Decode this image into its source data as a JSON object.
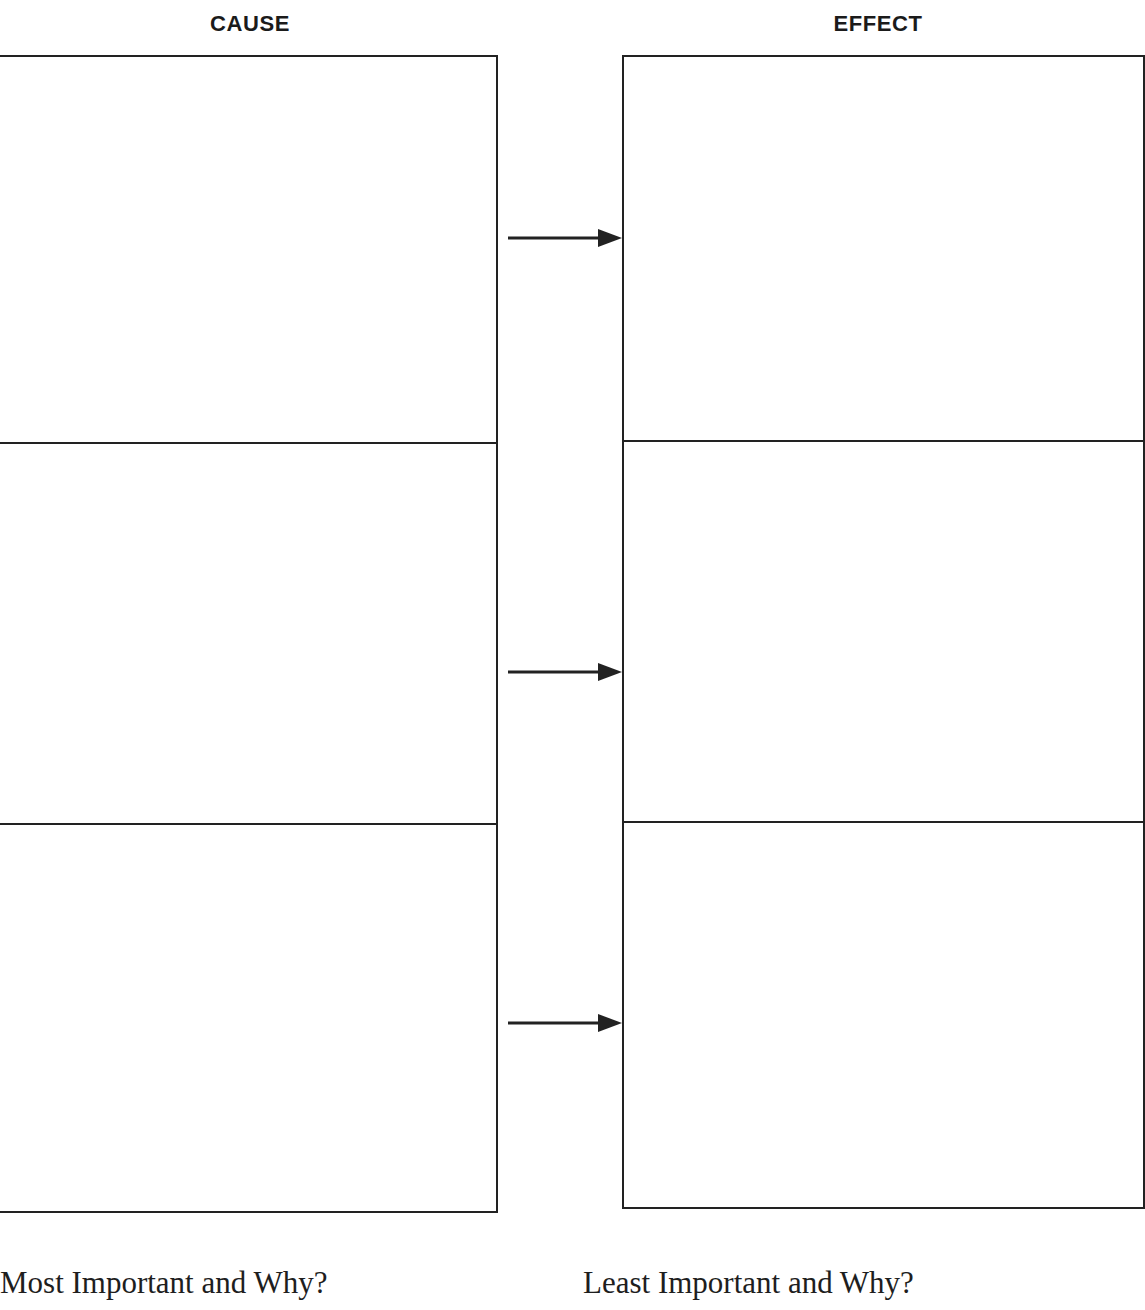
{
  "worksheet": {
    "title": "Cause and Effect Graphic Organizer",
    "columns": [
      {
        "id": "cause",
        "header": "CAUSE",
        "cells": [
          {
            "id": "cause-1",
            "value": ""
          },
          {
            "id": "cause-2",
            "value": ""
          },
          {
            "id": "cause-3",
            "value": ""
          }
        ]
      },
      {
        "id": "effect",
        "header": "EFFECT",
        "cells": [
          {
            "id": "effect-1",
            "value": ""
          },
          {
            "id": "effect-2",
            "value": ""
          },
          {
            "id": "effect-3",
            "value": ""
          }
        ]
      }
    ],
    "connectors": [
      {
        "id": "arrow-1",
        "from": "cause-1",
        "to": "effect-1",
        "direction": "right"
      },
      {
        "id": "arrow-2",
        "from": "cause-2",
        "to": "effect-2",
        "direction": "right"
      },
      {
        "id": "arrow-3",
        "from": "cause-3",
        "to": "effect-3",
        "direction": "right"
      }
    ],
    "prompts": {
      "most_important": "Most Important and Why?",
      "least_important": "Least Important and Why?"
    },
    "colors": {
      "ink": "#222222",
      "text": "#1e1e1e",
      "page": "#ffffff"
    }
  }
}
